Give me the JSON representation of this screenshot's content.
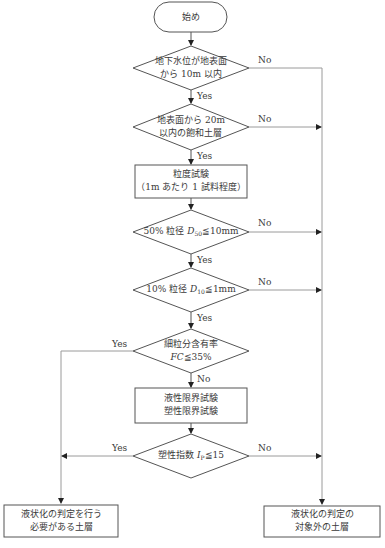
{
  "flowchart": {
    "start": {
      "label": "始め"
    },
    "decision1": {
      "line1": "地下水位が地表面",
      "line2": "から 10m 以内",
      "yes": "Yes",
      "no": "No"
    },
    "decision2": {
      "line1": "地表面から 20m",
      "line2": "以内の飽和土層",
      "yes": "Yes",
      "no": "No"
    },
    "process1": {
      "line1": "粒度試験",
      "line2": "（1m あたり 1 試料程度）"
    },
    "decision3": {
      "prefix": "50% 粒径 ",
      "var": "D",
      "sub": "50",
      "suffix": "≦10mm",
      "yes": "Yes",
      "no": "No"
    },
    "decision4": {
      "prefix": "10% 粒径 ",
      "var": "D",
      "sub": "10",
      "suffix": "≦1mm",
      "yes": "Yes",
      "no": "No"
    },
    "decision5": {
      "line1": "細粒分含有率",
      "var": "FC",
      "suffix": "≦35%",
      "yes": "Yes",
      "no": "No"
    },
    "process2": {
      "line1": "液性限界試験",
      "line2": "塑性限界試験"
    },
    "decision6": {
      "prefix": "塑性指数 ",
      "var": "I",
      "sub": "P",
      "suffix": "≦15",
      "yes": "Yes",
      "no": "No"
    },
    "end_left": {
      "line1": "液状化の判定を行う",
      "line2": "必要がある土層"
    },
    "end_right": {
      "line1": "液状化の判定の",
      "line2": "対象外の土層"
    }
  },
  "colors": {
    "line": "#555555",
    "side_line": "#9a9a9a",
    "text": "#3a3a3a"
  }
}
